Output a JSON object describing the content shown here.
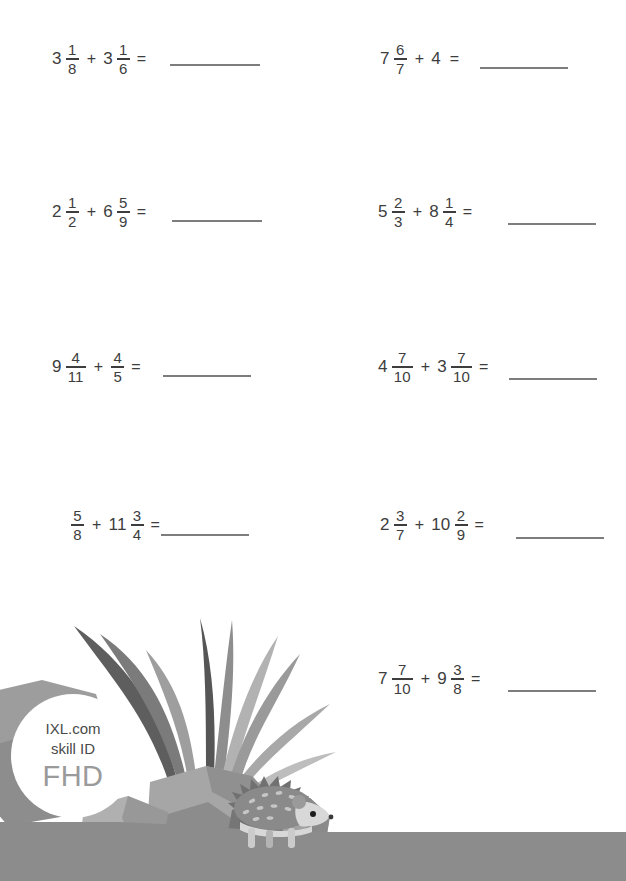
{
  "page": {
    "width": 626,
    "height": 881,
    "background": "#ffffff",
    "text_color": "#3d3d3d",
    "rule_color": "#7d7d7d"
  },
  "worksheet": {
    "topic": "adding mixed numbers",
    "operator": "+",
    "equals": "=",
    "columns": 2,
    "problems": [
      {
        "id": "p1",
        "column": "left",
        "row": 1,
        "terms": [
          {
            "whole": "3",
            "num": "1",
            "den": "8"
          },
          {
            "whole": "3",
            "num": "1",
            "den": "6"
          }
        ],
        "answer": ""
      },
      {
        "id": "p2",
        "column": "right",
        "row": 1,
        "terms": [
          {
            "whole": "7",
            "num": "6",
            "den": "7"
          },
          {
            "whole": "4",
            "num": "",
            "den": ""
          }
        ],
        "answer": ""
      },
      {
        "id": "p3",
        "column": "left",
        "row": 2,
        "terms": [
          {
            "whole": "2",
            "num": "1",
            "den": "2"
          },
          {
            "whole": "6",
            "num": "5",
            "den": "9"
          }
        ],
        "answer": ""
      },
      {
        "id": "p4",
        "column": "right",
        "row": 2,
        "terms": [
          {
            "whole": "5",
            "num": "2",
            "den": "3"
          },
          {
            "whole": "8",
            "num": "1",
            "den": "4"
          }
        ],
        "answer": ""
      },
      {
        "id": "p5",
        "column": "left",
        "row": 3,
        "terms": [
          {
            "whole": "9",
            "num": "4",
            "den": "11"
          },
          {
            "whole": "",
            "num": "4",
            "den": "5"
          }
        ],
        "answer": ""
      },
      {
        "id": "p6",
        "column": "right",
        "row": 3,
        "terms": [
          {
            "whole": "4",
            "num": "7",
            "den": "10"
          },
          {
            "whole": "3",
            "num": "7",
            "den": "10"
          }
        ],
        "answer": ""
      },
      {
        "id": "p7",
        "column": "left",
        "row": 4,
        "terms": [
          {
            "whole": "",
            "num": "5",
            "den": "8"
          },
          {
            "whole": "11",
            "num": "3",
            "den": "4"
          }
        ],
        "answer": ""
      },
      {
        "id": "p8",
        "column": "right",
        "row": 4,
        "terms": [
          {
            "whole": "2",
            "num": "3",
            "den": "7"
          },
          {
            "whole": "10",
            "num": "2",
            "den": "9"
          }
        ],
        "answer": ""
      },
      {
        "id": "p9",
        "column": "right",
        "row": 5,
        "terms": [
          {
            "whole": "7",
            "num": "7",
            "den": "10"
          },
          {
            "whole": "9",
            "num": "3",
            "den": "8"
          }
        ],
        "answer": ""
      }
    ]
  },
  "badge": {
    "line1": "IXL.com",
    "line2": "skill ID",
    "code": "FHD"
  },
  "illustration": {
    "description": "grayscale scene with grass tuft, rocks and a hedgehog on a ground strip",
    "ground_color": "#8c8c8c",
    "rock_colors": [
      "#9e9e9e",
      "#b4b4b4",
      "#8a8a8a",
      "#777777"
    ],
    "grass_colors": [
      "#5d5d5d",
      "#8f8f8f",
      "#b0b0b0",
      "#6e6e6e"
    ],
    "hedgehog_colors": {
      "spikes": "#7a7a7a",
      "body": "#cfcfcf",
      "eye": "#1c1c1c"
    }
  }
}
